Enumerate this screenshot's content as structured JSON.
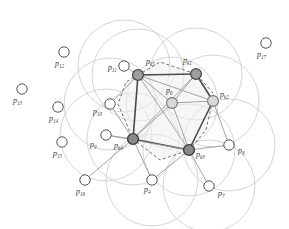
{
  "figure": {
    "type": "geometric-diagram",
    "width": 289,
    "height": 229,
    "background": "#ffffff",
    "colors": {
      "circle_stroke": "#c9c9c9",
      "dashed_stroke": "#6f6f6f",
      "edge_stroke": "#4a4a4a",
      "edge_light": "#9a9a9a",
      "node_hollow_fill": "#ffffff",
      "node_hollow_stroke": "#555555",
      "node_selected_fill": "#9e9e9e",
      "node_selected_stroke": "#4a4a4a",
      "node_dark_fill": "#8a8a8a",
      "label_color": "#3a3a3a",
      "shade_fill": "#efefef"
    },
    "node_radius_hollow": 5.2,
    "node_radius_selected": 5.4,
    "coverage_radius": 46
  },
  "nodes": [
    {
      "id": "k1",
      "label_base": "p",
      "label_sub": "k1",
      "x": 196,
      "y": 74,
      "cx": 196,
      "cy": 74,
      "style": "selected",
      "label_x": 183,
      "label_y": 63,
      "has_circle": true
    },
    {
      "id": "k2",
      "label_base": "p",
      "label_sub": "k2",
      "x": 213,
      "y": 101,
      "cx": 213,
      "cy": 101,
      "style": "selected-light",
      "label_x": 220,
      "label_y": 97,
      "has_circle": true
    },
    {
      "id": "k3",
      "label_base": "p",
      "label_sub": "k3",
      "x": 189,
      "y": 150,
      "cx": 189,
      "cy": 150,
      "style": "dark",
      "label_x": 196,
      "label_y": 157,
      "has_circle": true
    },
    {
      "id": "k4",
      "label_base": "p",
      "label_sub": "k4",
      "x": 133,
      "y": 139,
      "cx": 133,
      "cy": 139,
      "style": "dark",
      "label_x": 114,
      "label_y": 148,
      "has_circle": true
    },
    {
      "id": "k5",
      "label_base": "p",
      "label_sub": "k5",
      "x": 138,
      "y": 75,
      "cx": 138,
      "cy": 75,
      "style": "selected",
      "label_x": 146,
      "label_y": 64,
      "has_circle": true
    },
    {
      "id": "k6",
      "label_base": "p",
      "label_sub": "6",
      "x": 172,
      "y": 103,
      "cx": 172,
      "cy": 103,
      "style": "selected-light",
      "label_x": 166,
      "label_y": 93,
      "has_circle": true
    },
    {
      "id": "n4",
      "label_base": "p",
      "label_sub": "4",
      "x": 152,
      "y": 180,
      "cx": 152,
      "cy": 180,
      "style": "hollow",
      "label_x": 144,
      "label_y": 192,
      "has_circle": true
    },
    {
      "id": "n7",
      "label_base": "p",
      "label_sub": "7",
      "x": 209,
      "y": 186,
      "cx": 209,
      "cy": 186,
      "style": "hollow",
      "label_x": 218,
      "label_y": 196,
      "has_circle": true
    },
    {
      "id": "n8",
      "label_base": "p",
      "label_sub": "8",
      "x": 229,
      "y": 145,
      "cx": 229,
      "cy": 145,
      "style": "hollow",
      "label_x": 238,
      "label_y": 153,
      "has_circle": true
    },
    {
      "id": "n9",
      "label_base": "p",
      "label_sub": "9",
      "x": 106,
      "y": 135,
      "cx": 106,
      "cy": 135,
      "style": "hollow",
      "label_x": 90,
      "label_y": 147,
      "has_circle": true
    },
    {
      "id": "n10",
      "label_base": "p",
      "label_sub": "10",
      "x": 110,
      "y": 104,
      "cx": 110,
      "cy": 104,
      "style": "hollow",
      "label_x": 93,
      "label_y": 114,
      "has_circle": true
    },
    {
      "id": "n11",
      "label_base": "p",
      "label_sub": "11",
      "x": 124,
      "y": 66,
      "cx": 124,
      "cy": 66,
      "style": "hollow",
      "label_x": 108,
      "label_y": 70,
      "has_circle": true
    },
    {
      "id": "n12",
      "label_base": "p",
      "label_sub": "12",
      "x": 64,
      "y": 52,
      "cx": 64,
      "cy": 52,
      "style": "hollow",
      "label_x": 55,
      "label_y": 66,
      "has_circle": false
    },
    {
      "id": "n13",
      "label_base": "p",
      "label_sub": "13",
      "x": 22,
      "y": 89,
      "cx": 22,
      "cy": 89,
      "style": "hollow",
      "label_x": 13,
      "label_y": 103,
      "has_circle": false
    },
    {
      "id": "n14",
      "label_base": "p",
      "label_sub": "14",
      "x": 58,
      "y": 107,
      "cx": 58,
      "cy": 107,
      "style": "hollow",
      "label_x": 49,
      "label_y": 121,
      "has_circle": false
    },
    {
      "id": "n15",
      "label_base": "p",
      "label_sub": "15",
      "x": 62,
      "y": 142,
      "cx": 62,
      "cy": 142,
      "style": "hollow",
      "label_x": 53,
      "label_y": 156,
      "has_circle": false
    },
    {
      "id": "n16",
      "label_base": "p",
      "label_sub": "16",
      "x": 85,
      "y": 180,
      "cx": 85,
      "cy": 180,
      "style": "hollow",
      "label_x": 76,
      "label_y": 194,
      "has_circle": false
    },
    {
      "id": "n17",
      "label_base": "p",
      "label_sub": "17",
      "x": 266,
      "y": 43,
      "cx": 266,
      "cy": 43,
      "style": "hollow",
      "label_x": 257,
      "label_y": 57,
      "has_circle": false
    }
  ],
  "edges": [
    {
      "from": "k5",
      "to": "k1",
      "weight": "bold"
    },
    {
      "from": "k1",
      "to": "k2",
      "weight": "bold"
    },
    {
      "from": "k2",
      "to": "k3",
      "weight": "bold"
    },
    {
      "from": "k3",
      "to": "k4",
      "weight": "bold"
    },
    {
      "from": "k4",
      "to": "k5",
      "weight": "bold"
    },
    {
      "from": "k5",
      "to": "k6",
      "weight": "light"
    },
    {
      "from": "k1",
      "to": "k6",
      "weight": "light"
    },
    {
      "from": "k2",
      "to": "k6",
      "weight": "light"
    },
    {
      "from": "k3",
      "to": "k6",
      "weight": "light"
    },
    {
      "from": "k4",
      "to": "k6",
      "weight": "light"
    },
    {
      "from": "k5",
      "to": "k3",
      "weight": "light"
    },
    {
      "from": "k4",
      "to": "k1",
      "weight": "light"
    },
    {
      "from": "k4",
      "to": "n9",
      "weight": "light"
    },
    {
      "from": "k4",
      "to": "n10",
      "weight": "light"
    },
    {
      "from": "k5",
      "to": "n11",
      "weight": "light"
    },
    {
      "from": "k5",
      "to": "n10",
      "weight": "light"
    },
    {
      "from": "k4",
      "to": "n16",
      "weight": "light"
    },
    {
      "from": "k4",
      "to": "n4",
      "weight": "light"
    },
    {
      "from": "k3",
      "to": "n4",
      "weight": "light"
    },
    {
      "from": "k3",
      "to": "n7",
      "weight": "light"
    },
    {
      "from": "k3",
      "to": "n8",
      "weight": "light"
    },
    {
      "from": "k2",
      "to": "n8",
      "weight": "light"
    },
    {
      "from": "k3",
      "to": "n9",
      "weight": "light"
    },
    {
      "from": "k2",
      "to": "k5",
      "weight": "light"
    }
  ],
  "dashed_hull": {
    "description": "dashed closed curve through the selected nodes",
    "points": "138,75 160,62 196,74 214,94 206,130 189,150 160,160 133,139 118,104 126,82"
  },
  "coverage_circles": [
    {
      "cx": 138,
      "cy": 75,
      "r": 46
    },
    {
      "cx": 196,
      "cy": 74,
      "r": 46
    },
    {
      "cx": 213,
      "cy": 101,
      "r": 46
    },
    {
      "cx": 189,
      "cy": 150,
      "r": 46
    },
    {
      "cx": 133,
      "cy": 139,
      "r": 46
    },
    {
      "cx": 172,
      "cy": 103,
      "r": 46
    },
    {
      "cx": 229,
      "cy": 145,
      "r": 46
    },
    {
      "cx": 152,
      "cy": 180,
      "r": 46
    },
    {
      "cx": 106,
      "cy": 135,
      "r": 46
    },
    {
      "cx": 110,
      "cy": 104,
      "r": 46
    },
    {
      "cx": 124,
      "cy": 66,
      "r": 46
    },
    {
      "cx": 209,
      "cy": 186,
      "r": 46
    }
  ]
}
